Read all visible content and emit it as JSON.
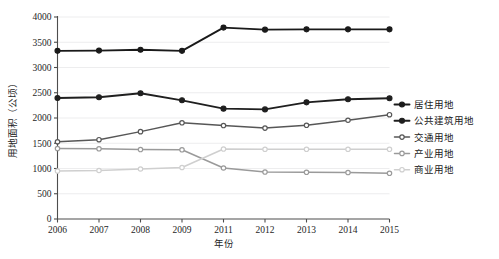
{
  "chart_data": {
    "type": "line",
    "title": "",
    "xlabel": "年份",
    "ylabel": "用地面积（公顷）",
    "categories": [
      "2006",
      "2007",
      "2008",
      "2009",
      "2011",
      "2012",
      "2013",
      "2014",
      "2015"
    ],
    "ylim": [
      0,
      4000
    ],
    "ytick_labels": [
      "0",
      "500",
      "1000",
      "1500",
      "2000",
      "2500",
      "3000",
      "3500",
      "4000"
    ],
    "ytick_values": [
      0,
      500,
      1000,
      1500,
      2000,
      2500,
      3000,
      3500,
      4000
    ],
    "grid": true,
    "legend_position": "right",
    "series": [
      {
        "name": "居住用地",
        "color": "#1a1a1a",
        "marker": "filled-circle",
        "values": [
          3330,
          3335,
          3350,
          3330,
          3790,
          3750,
          3755,
          3755,
          3755
        ]
      },
      {
        "name": "公共建筑用地",
        "color": "#1f1f1f",
        "marker": "filled-circle",
        "values": [
          2395,
          2410,
          2490,
          2350,
          2185,
          2170,
          2310,
          2370,
          2390
        ]
      },
      {
        "name": "交通用地",
        "color": "#575757",
        "marker": "open-circle",
        "values": [
          1530,
          1570,
          1730,
          1905,
          1850,
          1800,
          1855,
          1955,
          2065
        ]
      },
      {
        "name": "产业用地",
        "color": "#9a9a9a",
        "marker": "open-circle",
        "values": [
          1395,
          1390,
          1375,
          1370,
          1010,
          930,
          925,
          920,
          905
        ]
      },
      {
        "name": "商业用地",
        "color": "#cfcfcf",
        "marker": "open-circle",
        "values": [
          950,
          960,
          990,
          1020,
          1385,
          1380,
          1380,
          1380,
          1380
        ]
      }
    ]
  }
}
